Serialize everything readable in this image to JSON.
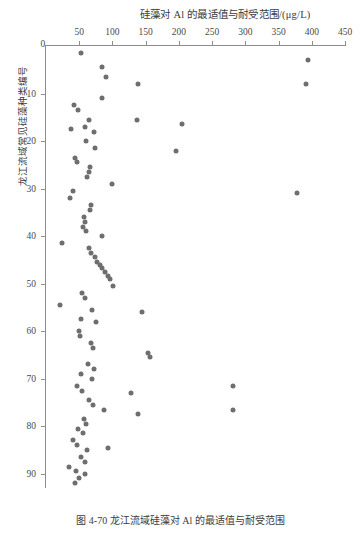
{
  "figure": {
    "caption": "图 4-70  龙江流域硅藻对 Al 的最适值与耐受范围",
    "x_axis_title": "硅藻对 Al 的最适值与耐受范围/(μg/L)",
    "y_axis_title": "龙江流域常见硅藻种类编号",
    "marker_color": "#6e6e6e",
    "axis_color": "#8d8d8d",
    "text_color": "#3c3c3c"
  },
  "chart_data": {
    "type": "scatter",
    "title": "硅藻对 Al 的最适值与耐受范围/(μg/L)",
    "xlabel": "硅藻对 Al 的最适值与耐受范围/(μg/L)",
    "ylabel": "龙江流域常见硅藻种类编号",
    "xlim": [
      0,
      450
    ],
    "ylim": [
      0,
      93
    ],
    "y_inverted": true,
    "x_axis_position": "top",
    "grid": false,
    "legend": null,
    "xticks": [
      0,
      50,
      100,
      150,
      200,
      250,
      300,
      350,
      400,
      450
    ],
    "xtick_labels": [
      "0",
      "50",
      "100",
      "150",
      "200",
      "250",
      "300",
      "350",
      "400",
      "450"
    ],
    "yticks": [
      0,
      10,
      20,
      30,
      40,
      50,
      60,
      70,
      80,
      90
    ],
    "ytick_labels": [
      "0",
      "10",
      "20",
      "30",
      "40",
      "50",
      "60",
      "70",
      "80",
      "90"
    ],
    "series": [
      {
        "name": "硅藻种类 Al 最适值",
        "points": [
          [
            52,
            1.5
          ],
          [
            395,
            3.0
          ],
          [
            85,
            4.5
          ],
          [
            138,
            8.0
          ],
          [
            392,
            8.0
          ],
          [
            85,
            11.0
          ],
          [
            42,
            12.5
          ],
          [
            48,
            13.5
          ],
          [
            64,
            15.5
          ],
          [
            137,
            15.5
          ],
          [
            205,
            16.5
          ],
          [
            38,
            17.5
          ],
          [
            72,
            18.0
          ],
          [
            60,
            20.0
          ],
          [
            74,
            21.5
          ],
          [
            196,
            22.0
          ],
          [
            44,
            23.5
          ],
          [
            47,
            24.5
          ],
          [
            66,
            25.5
          ],
          [
            65,
            26.5
          ],
          [
            62,
            27.5
          ],
          [
            99,
            29.0
          ],
          [
            40,
            30.5
          ],
          [
            378,
            31.0
          ],
          [
            36,
            32.0
          ],
          [
            68,
            33.5
          ],
          [
            66,
            34.5
          ],
          [
            57,
            36.0
          ],
          [
            58,
            37.0
          ],
          [
            56,
            38.0
          ],
          [
            60,
            39.0
          ],
          [
            84,
            40.0
          ],
          [
            24,
            41.5
          ],
          [
            64,
            42.5
          ],
          [
            68,
            43.5
          ],
          [
            73,
            44.5
          ],
          [
            77,
            45.5
          ],
          [
            81,
            46.0
          ],
          [
            85,
            46.8
          ],
          [
            89,
            47.5
          ],
          [
            93,
            48.3
          ],
          [
            96,
            49.0
          ],
          [
            101,
            50.5
          ],
          [
            54,
            52.0
          ],
          [
            59,
            53.0
          ],
          [
            21,
            54.5
          ],
          [
            69,
            55.5
          ],
          [
            145,
            56.0
          ],
          [
            52,
            57.5
          ],
          [
            75,
            58.0
          ],
          [
            50,
            60.0
          ],
          [
            51,
            61.0
          ],
          [
            68,
            62.5
          ],
          [
            70,
            63.5
          ],
          [
            154,
            64.5
          ],
          [
            157,
            65.5
          ],
          [
            63,
            67.0
          ],
          [
            72,
            68.0
          ],
          [
            52,
            69.0
          ],
          [
            69,
            70.0
          ],
          [
            47,
            71.5
          ],
          [
            54,
            72.5
          ],
          [
            128,
            73.0
          ],
          [
            65,
            74.5
          ],
          [
            70,
            75.5
          ],
          [
            88,
            76.5
          ],
          [
            138,
            77.5
          ],
          [
            57,
            78.5
          ],
          [
            60,
            79.5
          ],
          [
            48,
            80.5
          ],
          [
            55,
            81.5
          ],
          [
            40,
            83.0
          ],
          [
            46,
            84.0
          ],
          [
            94,
            84.5
          ],
          [
            62,
            85.0
          ],
          [
            52,
            86.5
          ],
          [
            58,
            87.5
          ],
          [
            35,
            88.5
          ],
          [
            45,
            89.5
          ],
          [
            58,
            90.0
          ],
          [
            50,
            91.0
          ],
          [
            43,
            92.0
          ],
          [
            282,
            71.5
          ],
          [
            281,
            76.5
          ],
          [
            58,
            17.0
          ],
          [
            90,
            6.5
          ]
        ]
      }
    ]
  }
}
